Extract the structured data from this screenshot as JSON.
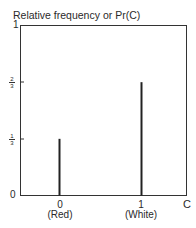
{
  "chart_data": {
    "type": "bar",
    "title": "Relative frequency or Pr(C)",
    "xlabel": "C",
    "ylabel": "Relative frequency or Pr(C)",
    "categories": [
      "0",
      "1"
    ],
    "category_sublabels": [
      "(Red)",
      "(White)"
    ],
    "values": [
      0.3333,
      0.6667
    ],
    "ylim": [
      0,
      1
    ],
    "yticks": [
      "0",
      "1/3",
      "2/3",
      "1"
    ],
    "grid": false,
    "legend": null
  },
  "labels": {
    "title": "Relative frequency or Pr(C)",
    "y0": "0",
    "y1": "1",
    "third_num": "1",
    "third_den": "3",
    "twothird_num": "2",
    "twothird_den": "3",
    "x0": "0",
    "x0_sub": "(Red)",
    "x1": "1",
    "x1_sub": "(White)",
    "xaxis": "C"
  }
}
